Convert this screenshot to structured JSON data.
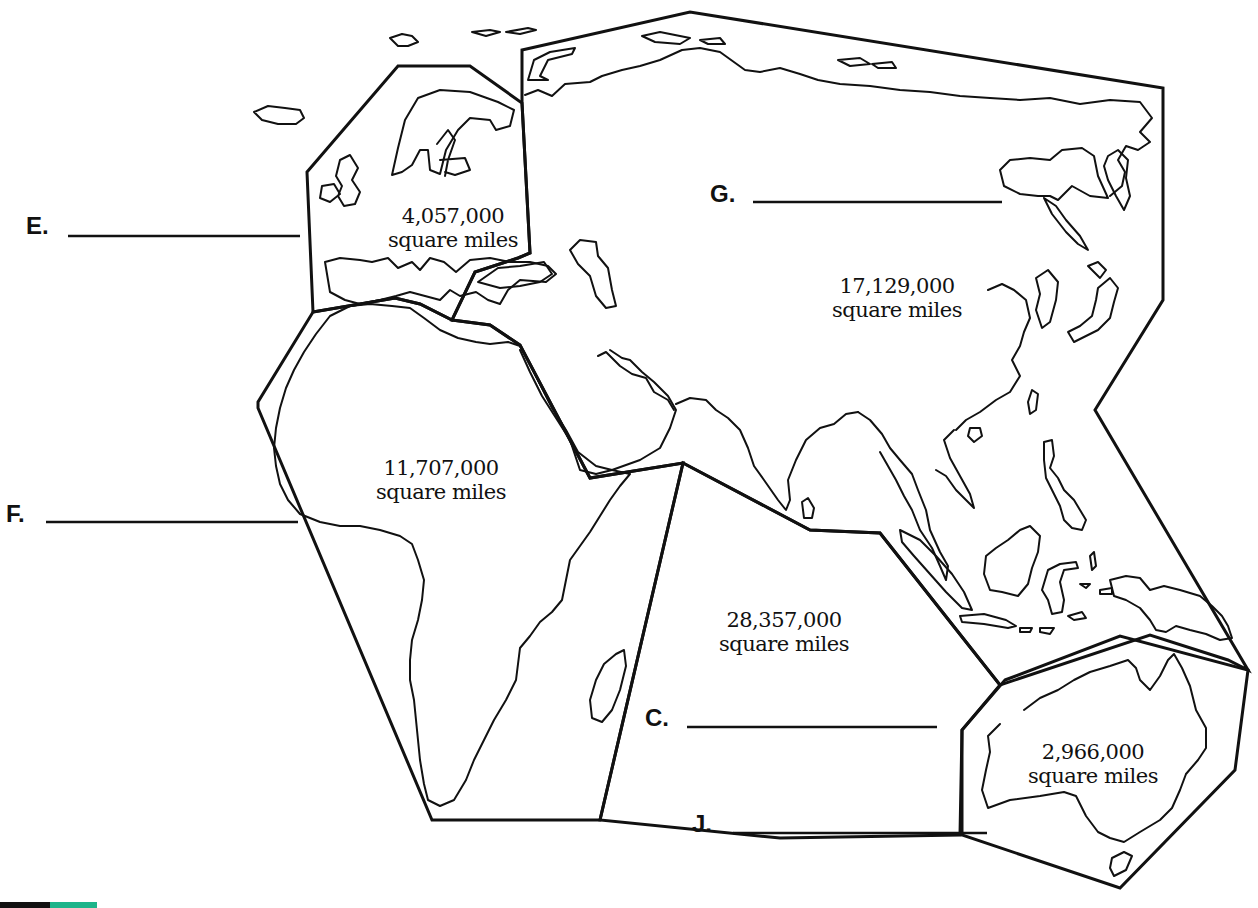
{
  "worksheet": {
    "regions": [
      {
        "id": "E",
        "letter": "E.",
        "area_value": "4,057,000",
        "area_unit": "square miles",
        "answer": "",
        "continent_hint": "Europe"
      },
      {
        "id": "G",
        "letter": "G.",
        "area_value": "17,129,000",
        "area_unit": "square miles",
        "answer": "",
        "continent_hint": "Asia"
      },
      {
        "id": "F",
        "letter": "F.",
        "area_value": "11,707,000",
        "area_unit": "square miles",
        "answer": "",
        "continent_hint": "Africa"
      },
      {
        "id": "C",
        "letter": "C.",
        "area_value": "28,357,000",
        "area_unit": "square miles",
        "answer": "",
        "continent_hint": "Indian Ocean"
      },
      {
        "id": "J",
        "letter": "J.",
        "area_value": "2,966,000",
        "area_unit": "square miles",
        "answer": "",
        "continent_hint": "Australia"
      }
    ]
  },
  "colors": {
    "ink": "#111111",
    "background": "#ffffff",
    "brand_dark": "#111111",
    "brand_green": "#1db48a"
  }
}
